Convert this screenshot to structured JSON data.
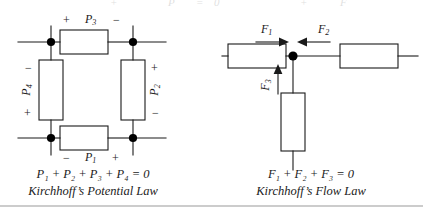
{
  "figure": {
    "background": "#ffffff",
    "stroke_color": "#1a1a1a",
    "node_color": "#000000",
    "rule_color": "#9a9a9a"
  },
  "top_cut_row": {
    "visible": true,
    "fragments": [
      "+",
      "P",
      "=",
      "0",
      "+",
      "F"
    ]
  },
  "left_diagram": {
    "name": "kirchhoff-potential-law-circuit",
    "components": [
      {
        "id": "P3",
        "label": "P",
        "subscript": "3",
        "orientation": "horizontal",
        "position": "top",
        "plus_side": "left",
        "minus_side": "right"
      },
      {
        "id": "P2",
        "label": "P",
        "subscript": "2",
        "orientation": "vertical",
        "position": "right",
        "plus_side": "top",
        "minus_side": "bottom"
      },
      {
        "id": "P1",
        "label": "P",
        "subscript": "1",
        "orientation": "horizontal",
        "position": "bottom",
        "plus_side": "right",
        "minus_side": "left"
      },
      {
        "id": "P4",
        "label": "P",
        "subscript": "4",
        "orientation": "vertical",
        "position": "left",
        "plus_side": "bottom",
        "minus_side": "top"
      }
    ],
    "labels": {
      "p3": "P",
      "p3_sub": "3",
      "p2": "P",
      "p2_sub": "2",
      "p1": "P",
      "p1_sub": "1",
      "p4": "P",
      "p4_sub": "4",
      "plus": "+",
      "minus": "−"
    },
    "junction_count": 4,
    "caption_equation": "P₁ + P₂ + P₃ + P₄ = 0",
    "caption_title": "Kirchhoff’s Potential Law"
  },
  "right_diagram": {
    "name": "kirchhoff-flow-law-circuit",
    "components": [
      {
        "id": "left-box",
        "orientation": "horizontal",
        "position": "left"
      },
      {
        "id": "right-box",
        "orientation": "horizontal",
        "position": "right"
      },
      {
        "id": "bottom-box",
        "orientation": "vertical",
        "position": "bottom"
      }
    ],
    "flows": [
      {
        "id": "F1",
        "label": "F",
        "subscript": "1",
        "direction": "right",
        "toward_node": true
      },
      {
        "id": "F2",
        "label": "F",
        "subscript": "2",
        "direction": "left",
        "toward_node": true
      },
      {
        "id": "F3",
        "label": "F",
        "subscript": "3",
        "direction": "up",
        "toward_node": true
      }
    ],
    "labels": {
      "f1": "F",
      "f1_sub": "1",
      "f2": "F",
      "f2_sub": "2",
      "f3": "F",
      "f3_sub": "3"
    },
    "junction_count": 1,
    "caption_equation": "F₁ + F₂ + F₃ = 0",
    "caption_title": "Kirchhoff’s Flow Law"
  },
  "bottom_rule": {
    "visible": true
  }
}
